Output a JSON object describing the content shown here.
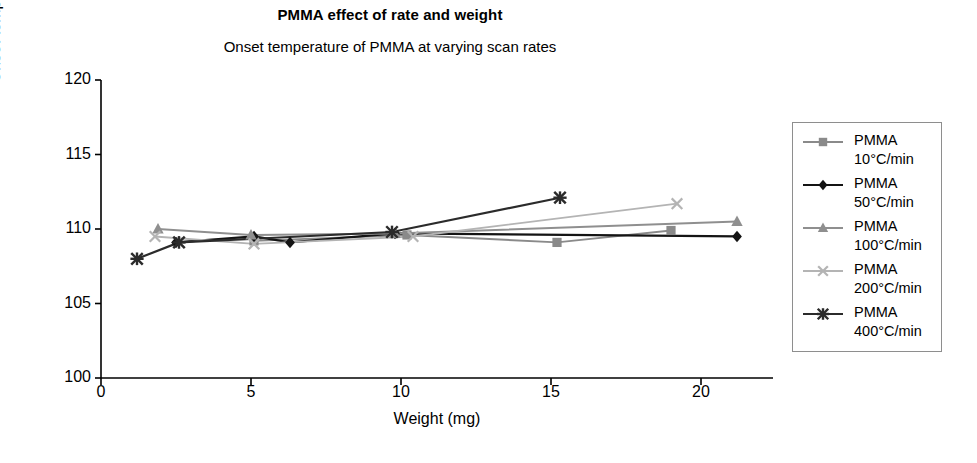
{
  "chart_data": {
    "type": "line",
    "title": "PMMA effect of rate and weight",
    "subtitle": "Onset temperature of PMMA at varying scan rates",
    "xlabel": "Weight (mg)",
    "ylabel": "Onset temperature (°C)",
    "xlim": [
      0,
      22.4
    ],
    "ylim": [
      100,
      120
    ],
    "xticks": [
      0,
      5,
      10,
      15,
      20
    ],
    "xtick_labels": [
      "0",
      "5",
      "10",
      "15",
      "20"
    ],
    "yticks": [
      100,
      105,
      110,
      115,
      120
    ],
    "ytick_labels": [
      "100",
      "105",
      "110",
      "115",
      "120"
    ],
    "grid": false,
    "legend_position": "right-outside",
    "series": [
      {
        "name": "PMMA 10°C/min",
        "label_line1": "PMMA",
        "label_line2": "10°C/min",
        "marker": "square",
        "color": "#8a8a8a",
        "points": [
          {
            "x": 5.1,
            "y": 109.2
          },
          {
            "x": 10.2,
            "y": 109.6
          },
          {
            "x": 15.2,
            "y": 109.1
          },
          {
            "x": 19.0,
            "y": 109.9
          }
        ]
      },
      {
        "name": "PMMA 50°C/min",
        "label_line1": "PMMA",
        "label_line2": "50°C/min",
        "marker": "diamond",
        "color": "#141414",
        "points": [
          {
            "x": 2.5,
            "y": 109.1
          },
          {
            "x": 5.1,
            "y": 109.5
          },
          {
            "x": 6.3,
            "y": 109.1
          },
          {
            "x": 9.8,
            "y": 109.7
          },
          {
            "x": 21.2,
            "y": 109.5
          }
        ]
      },
      {
        "name": "PMMA 100°C/min",
        "label_line1": "PMMA",
        "label_line2": "100°C/min",
        "marker": "triangle",
        "color": "#8f8f8f",
        "points": [
          {
            "x": 1.9,
            "y": 110.0
          },
          {
            "x": 5.0,
            "y": 109.6
          },
          {
            "x": 9.8,
            "y": 109.7
          },
          {
            "x": 21.2,
            "y": 110.5
          }
        ]
      },
      {
        "name": "PMMA 200°C/min",
        "label_line1": "PMMA",
        "label_line2": "200°C/min",
        "marker": "x",
        "color": "#b4b4b4",
        "points": [
          {
            "x": 1.8,
            "y": 109.5
          },
          {
            "x": 5.1,
            "y": 109.0
          },
          {
            "x": 10.4,
            "y": 109.5
          },
          {
            "x": 19.2,
            "y": 111.7
          }
        ]
      },
      {
        "name": "PMMA 400°C/min",
        "label_line1": "PMMA",
        "label_line2": "400°C/min",
        "marker": "star",
        "color": "#2b2b2b",
        "points": [
          {
            "x": 1.2,
            "y": 108.0
          },
          {
            "x": 2.6,
            "y": 109.1
          },
          {
            "x": 9.7,
            "y": 109.8
          },
          {
            "x": 15.3,
            "y": 112.1
          }
        ]
      }
    ]
  }
}
